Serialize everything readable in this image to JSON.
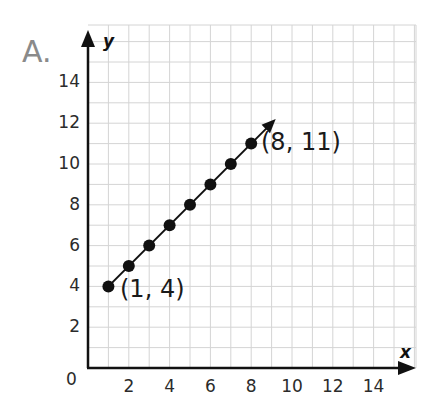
{
  "problem": {
    "label": "A."
  },
  "chart_data": {
    "type": "line",
    "title": "",
    "xlabel": "x",
    "ylabel": "y",
    "xlim": [
      0,
      16
    ],
    "ylim": [
      0,
      16.5
    ],
    "grid": true,
    "x_ticks": [
      0,
      2,
      4,
      6,
      8,
      10,
      12,
      14
    ],
    "y_ticks": [
      2,
      4,
      6,
      8,
      10,
      12,
      14
    ],
    "x_tick_labels": [
      "2",
      "4",
      "6",
      "8",
      "10",
      "12",
      "14"
    ],
    "y_tick_labels": [
      "2",
      "4",
      "6",
      "8",
      "10",
      "12",
      "14"
    ],
    "origin_label": "0",
    "series": [
      {
        "name": "y = x + 3",
        "x": [
          1,
          2,
          3,
          4,
          5,
          6,
          7,
          8
        ],
        "y": [
          4,
          5,
          6,
          7,
          8,
          9,
          10,
          11
        ],
        "markers": true,
        "line_extends_with_arrow_to": [
          9.2,
          12.2
        ]
      }
    ],
    "annotations": [
      {
        "text": "(1, 4)",
        "x": 1,
        "y": 4
      },
      {
        "text": "(8, 11)",
        "x": 8,
        "y": 11
      }
    ],
    "colors": {
      "grid": "#d4d4d4",
      "axis": "#111111",
      "series": "#111111",
      "problem_label": "#8a8a8a"
    }
  }
}
